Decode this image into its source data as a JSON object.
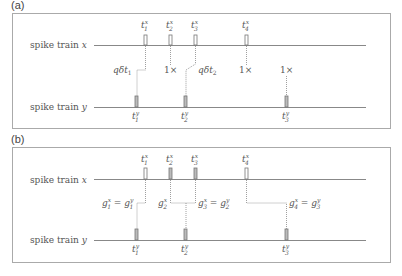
{
  "panels": [
    {
      "label": "(a)",
      "train_x_label": "spike train x",
      "train_y_label": "spike train y",
      "x_spikes": [
        "t1x",
        "t2x",
        "t3x",
        "t4x"
      ],
      "y_spikes": [
        "t1y",
        "t2y",
        "t3y"
      ],
      "annotations": [
        "qδt1",
        "1×",
        "qδt2",
        "1×",
        "1×"
      ]
    },
    {
      "label": "(b)",
      "train_x_label": "spike train x",
      "train_y_label": "spike train y",
      "x_spikes": [
        "t1x",
        "t2x",
        "t3x",
        "t4x"
      ],
      "y_spikes": [
        "t1y",
        "t2y",
        "t3y"
      ],
      "annotations": [
        "g1x = g1y",
        "g2x",
        "g3x = g2y",
        "g4x = g3y"
      ]
    }
  ],
  "colors": {
    "frame": "#999999",
    "line": "#888888",
    "spike": "#777777",
    "text": "#555555"
  }
}
